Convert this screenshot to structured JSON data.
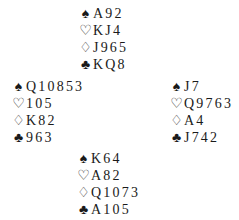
{
  "deal": {
    "north": {
      "spades": "A92",
      "hearts": "KJ4",
      "diamonds": "J965",
      "clubs": "KQ8"
    },
    "west": {
      "spades": "Q10853",
      "hearts": "105",
      "diamonds": "K82",
      "clubs": "963"
    },
    "east": {
      "spades": "J7",
      "hearts": "Q9763",
      "diamonds": "A4",
      "clubs": "J742"
    },
    "south": {
      "spades": "K64",
      "hearts": "A82",
      "diamonds": "Q1073",
      "clubs": "A105"
    }
  },
  "symbols": {
    "spades": "♠",
    "hearts": "♡",
    "diamonds": "♢",
    "clubs": "♣"
  }
}
